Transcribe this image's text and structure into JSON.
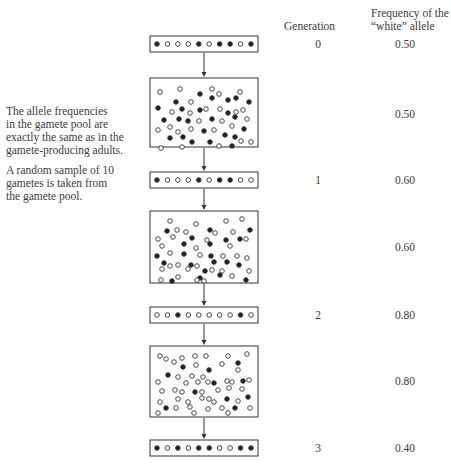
{
  "headers": {
    "generation": "Generation",
    "frequency_line1": "Frequency of the",
    "frequency_line2": "“white” allele"
  },
  "annotations": {
    "pool_note": [
      "The allele frequencies",
      "in the gamete pool are",
      "exactly the same as in the",
      "gamete-producing adults."
    ],
    "sample_note": [
      "A random sample of 10",
      "gametes is taken from",
      "the gamete pool."
    ]
  },
  "rows": [
    {
      "type": "sample",
      "generation": "0",
      "frequency": "0.50",
      "alleles": [
        "B",
        "W",
        "W",
        "W",
        "B",
        "W",
        "B",
        "B",
        "W",
        "B"
      ]
    },
    {
      "type": "pool",
      "generation": "",
      "frequency": "0.50"
    },
    {
      "type": "sample",
      "generation": "1",
      "frequency": "0.60",
      "alleles": [
        "B",
        "W",
        "W",
        "W",
        "B",
        "W",
        "B",
        "B",
        "W",
        "W"
      ]
    },
    {
      "type": "pool",
      "generation": "",
      "frequency": "0.60"
    },
    {
      "type": "sample",
      "generation": "2",
      "frequency": "0.80",
      "alleles": [
        "W",
        "W",
        "B",
        "W",
        "W",
        "W",
        "W",
        "W",
        "B",
        "W"
      ]
    },
    {
      "type": "pool",
      "generation": "",
      "frequency": "0.80"
    },
    {
      "type": "sample",
      "generation": "3",
      "frequency": "0.40",
      "alleles": [
        "B",
        "W",
        "B",
        "W",
        "B",
        "B",
        "W",
        "W",
        "B",
        "B"
      ]
    }
  ],
  "legend": {
    "W": "white allele",
    "B": "black allele"
  },
  "colors": {
    "stroke": "#333333",
    "black_allele": "#222222",
    "white_allele": "#ffffff"
  }
}
